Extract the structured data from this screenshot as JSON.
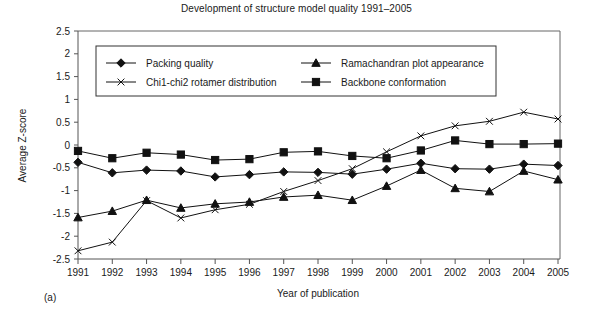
{
  "figure": {
    "panel_label": "(a)"
  },
  "chart_data": {
    "type": "line",
    "title": "Development of structure model quality 1991–2005",
    "xlabel": "Year of publication",
    "ylabel": "Average Z-score",
    "categories": [
      "1991",
      "1992",
      "1993",
      "1994",
      "1995",
      "1996",
      "1997",
      "1998",
      "1999",
      "2000",
      "2001",
      "2002",
      "2003",
      "2004",
      "2005"
    ],
    "x": [
      1991,
      1992,
      1993,
      1994,
      1995,
      1996,
      1997,
      1998,
      1999,
      2000,
      2001,
      2002,
      2003,
      2004,
      2005
    ],
    "xlim": [
      1991,
      2005
    ],
    "ylim": [
      -2.5,
      2.5
    ],
    "ytick_labels": [
      "2.5",
      "2",
      "1.5",
      "1",
      "0.5",
      "0",
      "-0.5",
      "-1",
      "-1.5",
      "-2",
      "-2.5"
    ],
    "yticks": [
      2.5,
      2,
      1.5,
      1,
      0.5,
      0,
      -0.5,
      -1,
      -1.5,
      -2,
      -2.5
    ],
    "grid": false,
    "legend_position": "top-inside",
    "series": [
      {
        "name": "Packing quality",
        "marker": "diamond",
        "values": [
          -0.38,
          -0.61,
          -0.55,
          -0.57,
          -0.7,
          -0.65,
          -0.59,
          -0.6,
          -0.64,
          -0.53,
          -0.4,
          -0.52,
          -0.53,
          -0.42,
          -0.45
        ]
      },
      {
        "name": "Ramachandran plot appearance",
        "marker": "triangle",
        "values": [
          -1.59,
          -1.45,
          -1.21,
          -1.38,
          -1.29,
          -1.25,
          -1.14,
          -1.1,
          -1.21,
          -0.9,
          -0.55,
          -0.95,
          -1.02,
          -0.57,
          -0.76
        ]
      },
      {
        "name": "Chi1-chi2 rotamer distribution",
        "marker": "cross",
        "values": [
          -2.32,
          -2.13,
          -1.22,
          -1.6,
          -1.42,
          -1.3,
          -1.02,
          -0.78,
          -0.52,
          -0.15,
          0.2,
          0.42,
          0.52,
          0.72,
          0.57
        ]
      },
      {
        "name": "Backbone conformation",
        "marker": "square",
        "values": [
          -0.13,
          -0.29,
          -0.17,
          -0.21,
          -0.33,
          -0.31,
          -0.16,
          -0.14,
          -0.24,
          -0.29,
          -0.12,
          0.1,
          0.02,
          0.02,
          0.03
        ]
      }
    ]
  },
  "legend": {
    "entries": [
      {
        "label": "Packing quality",
        "marker": "diamond"
      },
      {
        "label": "Ramachandran plot appearance",
        "marker": "triangle"
      },
      {
        "label": "Chi1-chi2 rotamer distribution",
        "marker": "cross"
      },
      {
        "label": "Backbone conformation",
        "marker": "square"
      }
    ]
  },
  "colors": {
    "ink": "#111111",
    "axis": "#555555",
    "background": "#ffffff"
  }
}
